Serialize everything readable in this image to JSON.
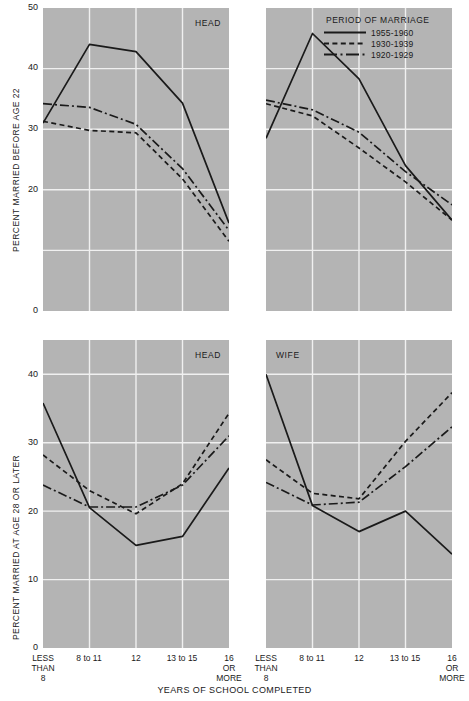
{
  "chart_data": [
    {
      "id": "top-left",
      "type": "line",
      "title": "HEAD",
      "panel_label": "HEAD",
      "xlabel": "",
      "ylabel": "PERCENT MARRIED BEFORE AGE 22",
      "categories": [
        "LESS THAN 8",
        "8 to 11",
        "12",
        "13 to 15",
        "16 OR MORE"
      ],
      "ylim": [
        0,
        50
      ],
      "yticks": [
        20,
        30,
        40,
        50
      ],
      "grid": true,
      "legend_position": "none",
      "series": [
        {
          "name": "1955-1960",
          "style": "solid",
          "values": [
            31.0,
            44.0,
            42.8,
            34.3,
            14.5
          ]
        },
        {
          "name": "1930-1939",
          "style": "dashed",
          "values": [
            31.3,
            29.8,
            29.4,
            21.8,
            11.5
          ]
        },
        {
          "name": "1920-1929",
          "style": "dashdot",
          "values": [
            34.2,
            33.6,
            30.8,
            23.5,
            13.3
          ]
        }
      ]
    },
    {
      "id": "top-right",
      "type": "line",
      "title": "",
      "panel_label": "",
      "xlabel": "",
      "ylabel": "",
      "categories": [
        "LESS THAN 8",
        "8 to 11",
        "12",
        "13 to 15",
        "16 OR MORE"
      ],
      "ylim": [
        0,
        50
      ],
      "yticks": [
        20,
        30,
        40,
        50
      ],
      "grid": true,
      "legend_position": "top-right",
      "series": [
        {
          "name": "1955-1960",
          "style": "solid",
          "values": [
            28.5,
            45.8,
            38.3,
            24.0,
            15.0
          ]
        },
        {
          "name": "1930-1939",
          "style": "dashed",
          "values": [
            34.2,
            32.2,
            26.9,
            21.3,
            15.0
          ]
        },
        {
          "name": "1920-1929",
          "style": "dashdot",
          "values": [
            34.8,
            33.2,
            29.5,
            23.0,
            17.5
          ]
        }
      ]
    },
    {
      "id": "bottom-left",
      "type": "line",
      "title": "HEAD",
      "panel_label": "HEAD",
      "xlabel": "YEARS OF SCHOOL COMPLETED",
      "ylabel": "PERCENT MARRIED AT AGE 28 OR LATER",
      "categories": [
        "LESS THAN 8",
        "8 to 11",
        "12",
        "13 to 15",
        "16 OR MORE"
      ],
      "ylim": [
        0,
        45
      ],
      "yticks": [
        0,
        10,
        20,
        30,
        40
      ],
      "grid": true,
      "legend_position": "none",
      "series": [
        {
          "name": "1955-1960",
          "style": "solid",
          "values": [
            35.8,
            20.5,
            15.0,
            16.3,
            26.3
          ]
        },
        {
          "name": "1930-1939",
          "style": "dashed",
          "values": [
            28.2,
            23.0,
            19.6,
            24.0,
            34.3
          ]
        },
        {
          "name": "1920-1929",
          "style": "dashdot",
          "values": [
            23.8,
            20.6,
            20.6,
            23.8,
            31.0
          ]
        }
      ]
    },
    {
      "id": "bottom-right",
      "type": "line",
      "title": "WIFE",
      "panel_label": "WIFE",
      "xlabel": "YEARS OF SCHOOL COMPLETED",
      "ylabel": "",
      "categories": [
        "LESS THAN 8",
        "8 to 11",
        "12",
        "13 to 15",
        "16 OR MORE"
      ],
      "ylim": [
        0,
        45
      ],
      "yticks": [
        0,
        10,
        20,
        30,
        40
      ],
      "grid": true,
      "legend_position": "none",
      "series": [
        {
          "name": "1955-1960",
          "style": "solid",
          "values": [
            40.0,
            20.8,
            17.0,
            20.0,
            13.7
          ]
        },
        {
          "name": "1930-1939",
          "style": "dashed",
          "values": [
            27.5,
            22.6,
            21.8,
            30.2,
            37.3
          ]
        },
        {
          "name": "1920-1929",
          "style": "dashdot",
          "values": [
            24.2,
            20.9,
            21.3,
            26.5,
            32.3
          ]
        }
      ]
    }
  ],
  "axes": {
    "top_ylabel": "PERCENT MARRIED BEFORE AGE 22",
    "bottom_ylabel": "PERCENT MARRIED AT AGE 28 OR LATER",
    "xlabel": "YEARS OF SCHOOL COMPLETED",
    "top_yticks": [
      "50",
      "40",
      "30",
      "20",
      "0"
    ],
    "bottom_yticks": [
      "40",
      "30",
      "20",
      "10",
      "0"
    ],
    "xticks": [
      "LESS\nTHAN\n8",
      "8 to 11",
      "12",
      "13 to 15",
      "16\nOR\nMORE"
    ]
  },
  "legend": {
    "title": "PERIOD OF MARRIAGE",
    "entries": [
      {
        "label": "1955-1960",
        "style": "solid"
      },
      {
        "label": "1930-1939",
        "style": "dashed"
      },
      {
        "label": "1920-1929",
        "style": "dashdot"
      }
    ]
  },
  "panel_labels": {
    "top_left": "HEAD",
    "bottom_left": "HEAD",
    "bottom_right": "WIFE"
  },
  "colors": {
    "panel_background": "#b4b4b4",
    "gridline": "#f0f0f0",
    "line": "#1a1a1a",
    "text": "#1a1a1a",
    "page_background": "#ffffff"
  }
}
